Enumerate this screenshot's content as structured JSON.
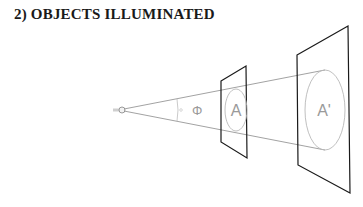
{
  "title": "2) OBJECTS ILLUMINATED",
  "labels": {
    "angle": "Φ",
    "near_area": "A",
    "far_area": "A'"
  },
  "colors": {
    "plane": "#1a1a1a",
    "rays": "#8a8a8a",
    "ellipse": "#b8b8b8",
    "label": "#9a9a9a"
  }
}
